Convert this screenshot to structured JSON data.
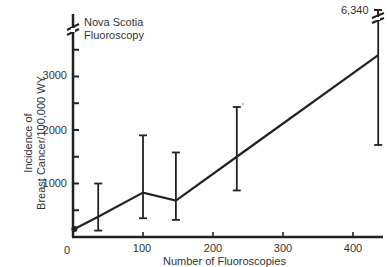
{
  "chart_data": {
    "type": "line",
    "title": "Nova Scotia Fluoroscopy",
    "xlabel": "Number of Fluoroscopies",
    "ylabel_line1": "Incidence of",
    "ylabel_line2": "Breast Cancer/100,000 WY",
    "x_ticks": [
      "0",
      "100",
      "200",
      "300",
      "400"
    ],
    "y_ticks": [
      "1000",
      "2000",
      "3000"
    ],
    "xlim": [
      0,
      440
    ],
    "ylim": [
      0,
      3600
    ],
    "top_annotation": "6,340",
    "series": [
      {
        "name": "Nova Scotia Fluoroscopy",
        "points": [
          {
            "x": 2,
            "y": 150,
            "err_low": null,
            "err_high": null
          },
          {
            "x": 36,
            "y": 380,
            "err_low": 120,
            "err_high": 1000
          },
          {
            "x": 100,
            "y": 830,
            "err_low": 350,
            "err_high": 1900
          },
          {
            "x": 147,
            "y": 680,
            "err_low": 320,
            "err_high": 1580
          },
          {
            "x": 234,
            "y": 1500,
            "err_low": 870,
            "err_high": 2430
          },
          {
            "x": 436,
            "y": 3400,
            "err_low": 1720,
            "err_high": 6340
          }
        ]
      }
    ],
    "grid": false,
    "legend": "none"
  }
}
